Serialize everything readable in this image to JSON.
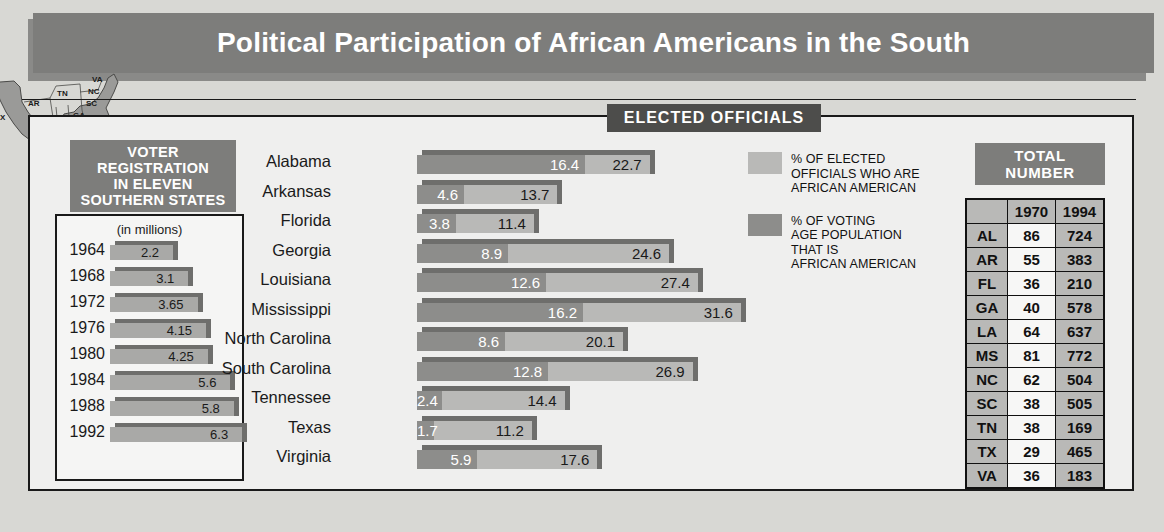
{
  "title": "Political Participation of African Americans in the South",
  "sections": {
    "elected_officials_header": "ELECTED OFFICIALS",
    "voter_registration_header": [
      "VOTER",
      "REGISTRATION",
      "IN ELEVEN",
      "SOUTHERN STATES"
    ],
    "voter_registration_units": "(in millions)",
    "total_number_header": [
      "TOTAL",
      "NUMBER"
    ]
  },
  "map": {
    "states": [
      "TX",
      "AR",
      "LA",
      "MS",
      "AL",
      "TN",
      "GA",
      "FL",
      "SC",
      "NC",
      "VA"
    ]
  },
  "legend": [
    {
      "swatch": "light",
      "lines": [
        "% OF ELECTED",
        "OFFICIALS WHO ARE",
        "AFRICAN AMERICAN"
      ]
    },
    {
      "swatch": "dark",
      "lines": [
        "% OF VOTING",
        "AGE POPULATION",
        "THAT IS",
        "AFRICAN AMERICAN"
      ]
    }
  ],
  "colors": {
    "banner": "#7d7d7b",
    "header_dark": "#4d4d4b",
    "bar_light": "#b9b9b7",
    "bar_dark": "#8d8d8b",
    "bar_top": "#6e6e6c",
    "page_bg": "#d8d8d4",
    "panel_bg": "#efefee"
  },
  "chart_data": [
    {
      "type": "bar",
      "name": "voter_registration",
      "title": "VOTER REGISTRATION IN ELEVEN SOUTHERN STATES",
      "subtitle": "(in millions)",
      "orientation": "horizontal",
      "xlabel": "",
      "ylabel": "",
      "xlim": [
        0,
        7
      ],
      "grid": false,
      "categories": [
        "1964",
        "1968",
        "1972",
        "1976",
        "1980",
        "1984",
        "1988",
        "1992"
      ],
      "values": [
        2.2,
        3.1,
        3.65,
        4.15,
        4.25,
        5.6,
        5.8,
        6.3
      ]
    },
    {
      "type": "bar",
      "name": "elected_officials",
      "title": "ELECTED OFFICIALS",
      "orientation": "horizontal",
      "xlabel": "",
      "ylabel": "",
      "xlim": [
        0,
        32
      ],
      "grid": false,
      "legend_position": "right",
      "categories": [
        "Alabama",
        "Arkansas",
        "Florida",
        "Georgia",
        "Louisiana",
        "Mississippi",
        "North Carolina",
        "South Carolina",
        "Tennessee",
        "Texas",
        "Virginia"
      ],
      "series": [
        {
          "name": "% OF ELECTED OFFICIALS WHO ARE AFRICAN AMERICAN",
          "values": [
            16.4,
            4.6,
            3.8,
            8.9,
            12.6,
            16.2,
            8.6,
            12.8,
            2.4,
            1.7,
            5.9
          ]
        },
        {
          "name": "% OF VOTING AGE POPULATION THAT IS AFRICAN AMERICAN",
          "values": [
            22.7,
            13.7,
            11.4,
            24.6,
            27.4,
            31.6,
            20.1,
            26.9,
            14.4,
            11.2,
            17.6
          ]
        }
      ]
    },
    {
      "type": "table",
      "name": "total_number",
      "title": "TOTAL NUMBER",
      "columns": [
        "",
        "1970",
        "1994"
      ],
      "rows": [
        [
          "AL",
          "86",
          "724"
        ],
        [
          "AR",
          "55",
          "383"
        ],
        [
          "FL",
          "36",
          "210"
        ],
        [
          "GA",
          "40",
          "578"
        ],
        [
          "LA",
          "64",
          "637"
        ],
        [
          "MS",
          "81",
          "772"
        ],
        [
          "NC",
          "62",
          "504"
        ],
        [
          "SC",
          "38",
          "505"
        ],
        [
          "TN",
          "38",
          "169"
        ],
        [
          "TX",
          "29",
          "465"
        ],
        [
          "VA",
          "36",
          "183"
        ]
      ]
    }
  ]
}
